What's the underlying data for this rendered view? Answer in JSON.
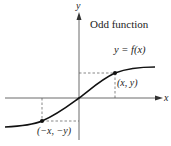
{
  "title": "Odd function",
  "equation": "y = f(x)",
  "axes": {
    "x_label": "x",
    "y_label": "y"
  },
  "points": [
    {
      "label": "(x, y)"
    },
    {
      "label": "(−x, −y)"
    }
  ],
  "colors": {
    "curve": "#111111",
    "axis": "#333333",
    "dash": "#555555"
  }
}
